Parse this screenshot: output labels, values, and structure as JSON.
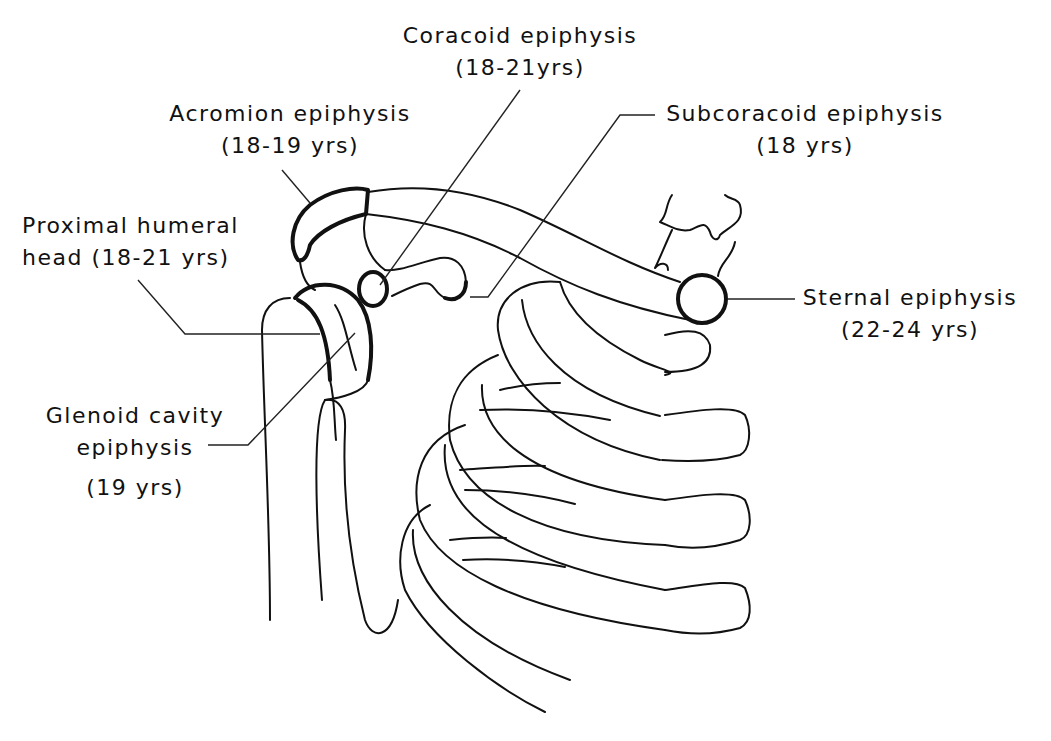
{
  "figure": {
    "labels": [
      {
        "id": "coracoid",
        "name": "Coracoid epiphysis",
        "age": "(18-21yrs)"
      },
      {
        "id": "acromion",
        "name": "Acromion epiphysis",
        "age": "(18-19 yrs)"
      },
      {
        "id": "subcoracoid",
        "name": "Subcoracoid epiphysis",
        "age": "(18 yrs)"
      },
      {
        "id": "humeral",
        "name": "Proximal humeral",
        "age": "head  (18-21 yrs)"
      },
      {
        "id": "sternal",
        "name": "Sternal epiphysis",
        "age": "(22-24 yrs)"
      },
      {
        "id": "glenoid",
        "name": "Glenoid cavity",
        "name2": "epiphysis",
        "age": "(19 yrs)"
      }
    ]
  },
  "colors": {
    "ink": "#111111",
    "background": "#ffffff"
  }
}
